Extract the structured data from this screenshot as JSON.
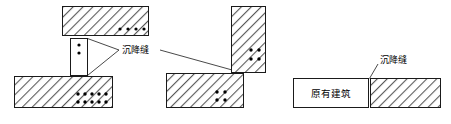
{
  "diagram": {
    "type": "architectural-detail",
    "background_color": "#ffffff",
    "line_color": "#1a1a1a",
    "hatch_color": "#555555",
    "dot_color": "#000000",
    "labels": {
      "settlement_joint": "沉降缝",
      "existing_building": "原有建筑"
    },
    "groups": [
      {
        "name": "left-group",
        "description": "上下错位墙体与沉降缝detail",
        "blocks": [
          {
            "name": "top-wall",
            "fill": "hatched",
            "x": 62,
            "y": 6,
            "w": 86,
            "h": 30,
            "dots": {
              "rows": 1,
              "cols": 4
            }
          },
          {
            "name": "bottom-wall",
            "fill": "hatched",
            "x": 14,
            "y": 76,
            "w": 98,
            "h": 32,
            "dots": {
              "rows": 2,
              "cols": 5
            }
          },
          {
            "name": "joint-detail-box",
            "fill": "plain",
            "x": 70,
            "y": 38,
            "w": 17,
            "h": 38,
            "dots": {
              "rows": 2,
              "cols": 1
            }
          }
        ]
      },
      {
        "name": "middle-group",
        "description": "竖向墙体与水平墙体交接沉降缝",
        "blocks": [
          {
            "name": "vertical-wall",
            "fill": "hatched",
            "x": 231,
            "y": 6,
            "w": 34,
            "h": 66,
            "dots": {
              "rows": 2,
              "cols": 2
            }
          },
          {
            "name": "horizontal-wall",
            "fill": "hatched",
            "x": 166,
            "y": 73,
            "w": 77,
            "h": 35,
            "dots": {
              "rows": 2,
              "cols": 2
            }
          }
        ]
      },
      {
        "name": "right-group",
        "description": "原有建筑与新建部分之间沉降缝",
        "blocks": [
          {
            "name": "existing-building-block",
            "fill": "plain",
            "x": 293,
            "y": 78,
            "w": 75,
            "h": 30,
            "label": "原有建筑"
          },
          {
            "name": "new-building-block",
            "fill": "hatched",
            "x": 370,
            "y": 78,
            "w": 70,
            "h": 30
          }
        ]
      }
    ],
    "annotations": [
      {
        "name": "settlement-joint-label-left",
        "text": "沉降缝",
        "x": 122,
        "y": 50
      },
      {
        "name": "settlement-joint-label-right",
        "text": "沉降缝",
        "x": 380,
        "y": 62
      }
    ]
  }
}
